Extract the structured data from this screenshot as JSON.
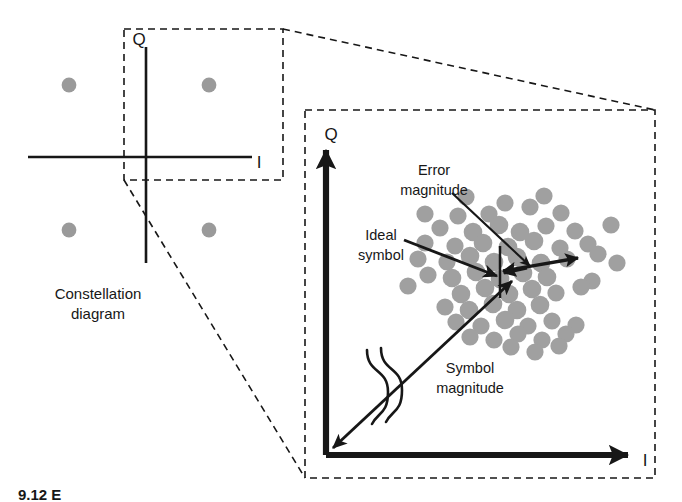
{
  "figure": {
    "background_color": "#ffffff",
    "ink_color": "#171717",
    "symbol_dot_color": "#9a9a9a",
    "cluster_dot_color": "#a0a0a0"
  },
  "left_panel": {
    "name": "constellation-diagram",
    "axis_q_label": "Q",
    "axis_i_label": "I",
    "caption_line1": "Constellation",
    "caption_line2": "diagram",
    "caption_full": "Constellation diagram",
    "symbols": [
      {
        "id": "sym-upper-left",
        "x": 69,
        "y": 85,
        "quadrant": "upper-left"
      },
      {
        "id": "sym-upper-right",
        "x": 209,
        "y": 85,
        "quadrant": "upper-right"
      },
      {
        "id": "sym-lower-left",
        "x": 69,
        "y": 230,
        "quadrant": "lower-left"
      },
      {
        "id": "sym-lower-right",
        "x": 209,
        "y": 230,
        "quadrant": "lower-right"
      }
    ],
    "axes": {
      "origin_x": 146,
      "origin_y": 157,
      "q_top_y": 47,
      "q_bottom_y": 263,
      "i_left_x": 28,
      "i_right_x": 252
    },
    "zoom_box": {
      "x": 124,
      "y": 29,
      "width": 159,
      "height": 151
    }
  },
  "right_panel": {
    "name": "evm-detail-panel",
    "axis_q_label": "Q",
    "axis_i_label": "I",
    "labels": {
      "error_magnitude_line1": "Error",
      "error_magnitude_line2": "magnitude",
      "error_magnitude_full": "Error magnitude",
      "ideal_symbol_line1": "Ideal",
      "ideal_symbol_line2": "symbol",
      "ideal_symbol_full": "Ideal symbol",
      "symbol_magnitude_line1": "Symbol",
      "symbol_magnitude_line2": "magnitude",
      "symbol_magnitude_full": "Symbol magnitude"
    },
    "dashed_border": {
      "x": 305,
      "y": 110,
      "width": 350,
      "height": 368
    },
    "axes": {
      "origin_x": 326,
      "origin_y": 455,
      "q_top_y": 146,
      "i_right_x": 632
    },
    "ideal_symbol_point": {
      "x": 500,
      "y": 272
    },
    "measured_symbol_point": {
      "x": 528,
      "y": 266
    },
    "error_vector": {
      "from_x": 500,
      "from_y": 272,
      "to_x": 575,
      "to_y": 259,
      "double_headed": true
    },
    "symbol_magnitude_vector": {
      "from_x": 330,
      "from_y": 451,
      "to_x": 510,
      "to_y": 282,
      "double_headed": true,
      "has_break_symbol": true
    },
    "cluster_center": {
      "x": 505,
      "y": 272
    },
    "cluster_points": [
      [
        505,
        203
      ],
      [
        530,
        207
      ],
      [
        458,
        216
      ],
      [
        489,
        214
      ],
      [
        561,
        213
      ],
      [
        440,
        228
      ],
      [
        473,
        232
      ],
      [
        499,
        225
      ],
      [
        520,
        232
      ],
      [
        546,
        226
      ],
      [
        575,
        231
      ],
      [
        425,
        243
      ],
      [
        455,
        246
      ],
      [
        483,
        243
      ],
      [
        508,
        247
      ],
      [
        534,
        241
      ],
      [
        560,
        248
      ],
      [
        588,
        244
      ],
      [
        418,
        259
      ],
      [
        447,
        262
      ],
      [
        470,
        256
      ],
      [
        494,
        262
      ],
      [
        517,
        257
      ],
      [
        541,
        263
      ],
      [
        567,
        259
      ],
      [
        598,
        254
      ],
      [
        428,
        275
      ],
      [
        452,
        278
      ],
      [
        476,
        272
      ],
      [
        500,
        279
      ],
      [
        523,
        273
      ],
      [
        547,
        277
      ],
      [
        571,
        271
      ],
      [
        592,
        281
      ],
      [
        436,
        291
      ],
      [
        461,
        294
      ],
      [
        485,
        288
      ],
      [
        509,
        294
      ],
      [
        532,
        289
      ],
      [
        556,
        293
      ],
      [
        581,
        287
      ],
      [
        445,
        307
      ],
      [
        469,
        310
      ],
      [
        493,
        304
      ],
      [
        517,
        310
      ],
      [
        540,
        305
      ],
      [
        564,
        309
      ],
      [
        609,
        289
      ],
      [
        456,
        322
      ],
      [
        481,
        326
      ],
      [
        505,
        320
      ],
      [
        528,
        326
      ],
      [
        552,
        321
      ],
      [
        576,
        325
      ],
      [
        470,
        337
      ],
      [
        494,
        340
      ],
      [
        518,
        334
      ],
      [
        542,
        340
      ],
      [
        566,
        334
      ],
      [
        487,
        352
      ],
      [
        511,
        347
      ],
      [
        535,
        352
      ],
      [
        559,
        346
      ],
      [
        425,
        214
      ],
      [
        611,
        225
      ],
      [
        408,
        286
      ],
      [
        617,
        263
      ],
      [
        466,
        197
      ],
      [
        544,
        196
      ]
    ]
  },
  "connectors": {
    "name": "zoom-connector-lines",
    "top_line": {
      "from_x": 283,
      "from_y": 29,
      "to_x": 655,
      "to_y": 110
    },
    "bottom_line": {
      "from_x": 124,
      "from_y": 180,
      "to_x": 305,
      "to_y": 478
    }
  },
  "caption": {
    "text_partial": "9.12  E"
  }
}
